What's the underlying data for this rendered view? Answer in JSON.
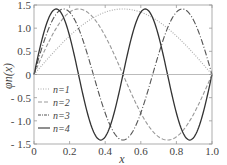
{
  "chart_data": {
    "type": "line",
    "title": "",
    "xlabel": "x",
    "ylabel": "φn(x)",
    "xlim": [
      0,
      1
    ],
    "ylim": [
      -1.5,
      1.5
    ],
    "xticks": [
      "0",
      "0.2",
      "0.4",
      "0.6",
      "0.8",
      "1.0"
    ],
    "xtick_values": [
      0,
      0.2,
      0.4,
      0.6,
      0.8,
      1.0
    ],
    "yticks": [
      "1.5",
      "1.0",
      "0.5",
      "0",
      "- 0.5",
      "- 1.0",
      "- 1.5"
    ],
    "ytick_values": [
      1.5,
      1.0,
      0.5,
      0,
      -0.5,
      -1.0,
      -1.5
    ],
    "grid": false,
    "zero_line": true,
    "legend_position": "center-left",
    "function": "sqrt(2) * sin(n * pi * x)",
    "series": [
      {
        "name": "n=1",
        "n": 1,
        "style": "dotted",
        "color": "#aaaaaa"
      },
      {
        "name": "n=2",
        "n": 2,
        "style": "dashed",
        "color": "#999999"
      },
      {
        "name": "n=3",
        "n": 3,
        "style": "dashdot",
        "color": "#555555"
      },
      {
        "name": "n=4",
        "n": 4,
        "style": "solid",
        "color": "#333333"
      }
    ],
    "sample_points": {
      "x": [
        0,
        0.125,
        0.1667,
        0.25,
        0.375,
        0.5,
        0.625,
        0.75,
        0.8333,
        0.875,
        1.0
      ],
      "n1": [
        0,
        0.541,
        0.707,
        1.0,
        1.307,
        1.414,
        1.307,
        1.0,
        0.707,
        0.541,
        0
      ],
      "n2": [
        0,
        1.0,
        1.225,
        1.414,
        1.0,
        0,
        -1.0,
        -1.414,
        -1.225,
        -1.0,
        0
      ],
      "n3": [
        0,
        1.307,
        1.414,
        1.0,
        -0.541,
        -1.414,
        -0.541,
        1.0,
        1.414,
        1.307,
        0
      ],
      "n4": [
        0,
        1.414,
        1.225,
        0,
        -1.414,
        0,
        1.414,
        0,
        -1.225,
        -1.414,
        0
      ]
    }
  }
}
